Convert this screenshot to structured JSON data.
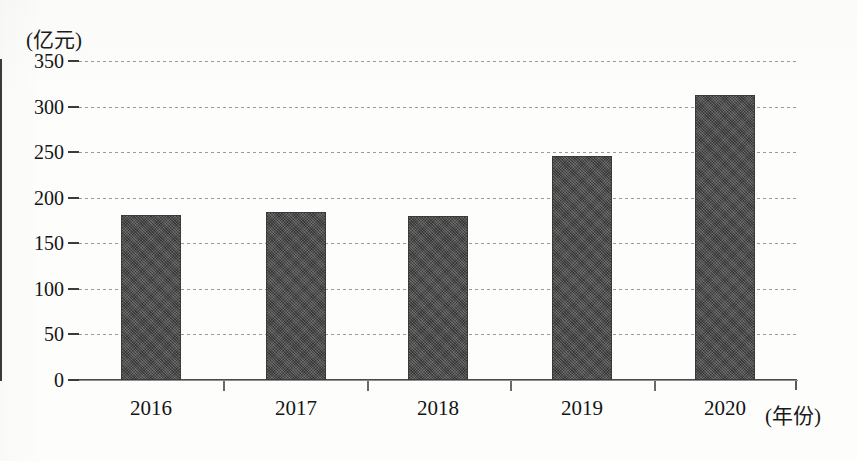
{
  "chart_data": {
    "type": "bar",
    "title": "",
    "subtitle": "",
    "xlabel": "(年份)",
    "ylabel": "(亿元)",
    "categories": [
      "2016",
      "2017",
      "2018",
      "2019",
      "2020"
    ],
    "values": [
      181,
      184,
      180,
      246,
      313
    ],
    "series": [
      {
        "name": "",
        "values": [
          181,
          184,
          180,
          246,
          313
        ]
      }
    ],
    "ylim": [
      0,
      350
    ],
    "xlim_note": "categorical",
    "yticks": [
      0,
      50,
      100,
      150,
      200,
      250,
      300,
      350
    ],
    "ytick_labels": [
      "0",
      "50",
      "100",
      "150",
      "200",
      "250",
      "300",
      "350"
    ],
    "grid": true,
    "grid_axis": "y",
    "grid_style": "dashed",
    "legend": false,
    "legend_position": "none",
    "bar_color": "#4b4b4b",
    "bar_pattern": "dithered-checker",
    "axis_color": "#3b3b3b",
    "background_color": "#fdfdfc",
    "annotations": []
  },
  "axes": {
    "y_unit_caption": "(亿元)",
    "x_unit_caption": "(年份)"
  }
}
